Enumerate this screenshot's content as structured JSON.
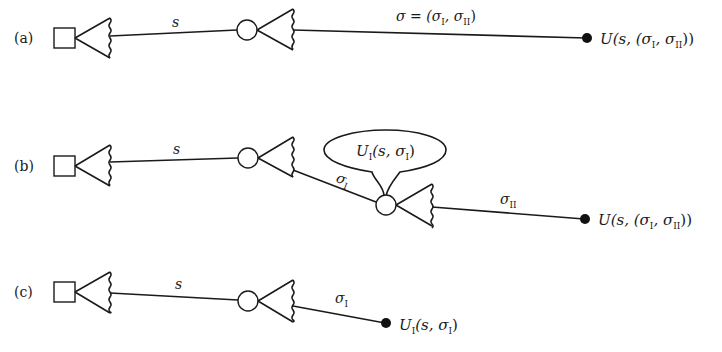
{
  "panels": [
    {
      "id": "a",
      "label": "(a)",
      "edge1_label": "s",
      "edge2_label": "σ = (σ",
      "edge2_sub1": "I",
      "edge2_mid": ", σ",
      "edge2_sub2": "II",
      "edge2_end": ")",
      "payoff": "U(s, (σ",
      "payoff_sub1": "I",
      "payoff_mid": ", σ",
      "payoff_sub2": "II",
      "payoff_end": "))"
    },
    {
      "id": "b",
      "label": "(b)",
      "edge1_label": "s",
      "edge2_label": "σ",
      "edge2_sub": "I",
      "bubble_text": "U",
      "bubble_sub": "I",
      "bubble_args": "(s, σ",
      "bubble_args_sub": "I",
      "bubble_end": ")",
      "edge3_label": "σ",
      "edge3_sub": "II",
      "payoff": "U(s, (σ",
      "payoff_sub1": "I",
      "payoff_mid": ", σ",
      "payoff_sub2": "II",
      "payoff_end": "))"
    },
    {
      "id": "c",
      "label": "(c)",
      "edge1_label": "s",
      "edge2_label": "σ",
      "edge2_sub": "I",
      "payoff": "U",
      "payoff_sub": "I",
      "payoff_args": "(s, σ",
      "payoff_args_sub": "I",
      "payoff_end": ")"
    }
  ]
}
